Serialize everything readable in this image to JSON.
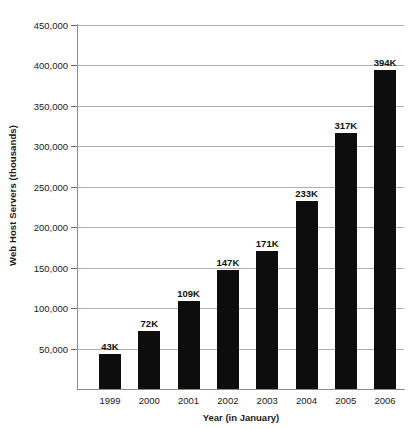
{
  "chart_data": {
    "type": "bar",
    "title": "",
    "xlabel": "Year (in January)",
    "ylabel": "Web Host Servers (thousands)",
    "categories": [
      "1999",
      "2000",
      "2001",
      "2002",
      "2003",
      "2004",
      "2005",
      "2006"
    ],
    "values": [
      43000,
      72000,
      109000,
      147000,
      171000,
      233000,
      317000,
      394000
    ],
    "data_labels": [
      "43K",
      "72K",
      "109K",
      "147K",
      "171K",
      "233K",
      "317K",
      "394K"
    ],
    "ylim": [
      0,
      450000
    ],
    "ytick_labels": [
      "450,000",
      "400,000",
      "350,000",
      "300,000",
      "250,000",
      "200,000",
      "150,000",
      "100,000",
      "50,000"
    ],
    "ytick_values": [
      450000,
      400000,
      350000,
      300000,
      250000,
      200000,
      150000,
      100000,
      50000
    ],
    "grid": true,
    "legend": false,
    "bar_color": "#0d0d0d",
    "gridline_color": "#b0b0b0",
    "axis_color": "#8a8a8a"
  }
}
